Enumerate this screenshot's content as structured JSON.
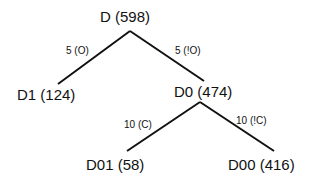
{
  "diagram": {
    "type": "tree",
    "nodes": [
      {
        "id": "D",
        "label": "D (598)"
      },
      {
        "id": "D1",
        "label": "D1 (124)"
      },
      {
        "id": "D0",
        "label": "D0 (474)"
      },
      {
        "id": "D01",
        "label": "D01 (58)"
      },
      {
        "id": "D00",
        "label": "D00 (416)"
      }
    ],
    "edges": [
      {
        "from": "D",
        "to": "D1",
        "label": "5 (O)"
      },
      {
        "from": "D",
        "to": "D0",
        "label": "5 (!O)"
      },
      {
        "from": "D0",
        "to": "D01",
        "label": "10 (C)"
      },
      {
        "from": "D0",
        "to": "D00",
        "label": "10 (!C)"
      }
    ],
    "line_color": "#111111"
  }
}
